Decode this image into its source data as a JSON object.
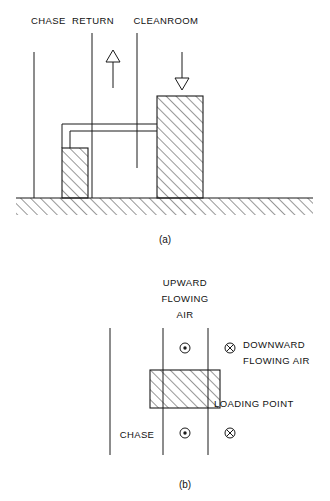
{
  "figure_a": {
    "caption": "(a)",
    "labels": {
      "chase": "CHASE",
      "return": "RETURN",
      "cleanroom": "CLEANROOM"
    },
    "arrows": {
      "return_direction": "up",
      "cleanroom_direction": "down"
    },
    "elements": {
      "ground": "hatched-ground-band",
      "chase_block": "small-hatched-block",
      "cleanroom_block": "tall-hatched-block",
      "duct": "double-line-duct"
    }
  },
  "figure_b": {
    "caption": "(b)",
    "labels": {
      "upward_flowing_air_line1": "UPWARD",
      "upward_flowing_air_line2": "FLOWING",
      "upward_flowing_air_line3": "AIR",
      "downward_flowing_air_line1": "DOWNWARD",
      "downward_flowing_air_line2": "FLOWING AIR",
      "loading_point": "LOADING POINT",
      "chase": "CHASE"
    },
    "symbols": {
      "out_of_page": "circle-dot-icon",
      "into_page": "circle-cross-icon",
      "out_of_page_count": 2,
      "into_page_count": 2
    },
    "elements": {
      "chase_wall": "vertical-line",
      "duct_left_wall": "vertical-line",
      "duct_right_wall": "vertical-line",
      "loading_point_block": "hatched-rectangle"
    }
  },
  "colors": {
    "ink": "#1a1a1a",
    "background": "#ffffff"
  }
}
